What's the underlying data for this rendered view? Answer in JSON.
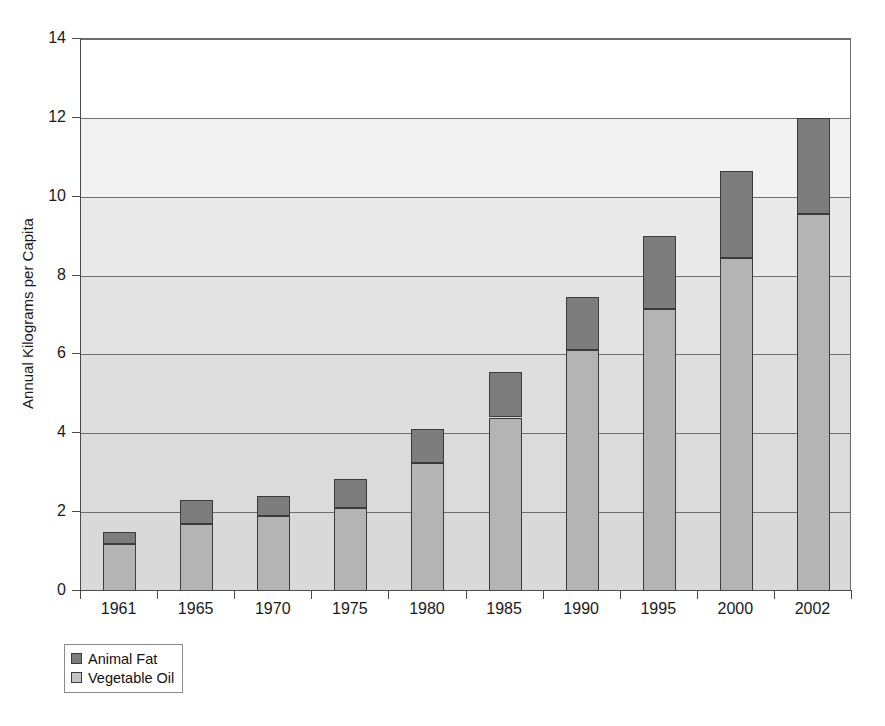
{
  "chart_data": {
    "type": "bar",
    "subtype": "stacked-bar",
    "title": "",
    "xlabel": "",
    "ylabel": "Annual Kilograms per Capita",
    "ylim": [
      0,
      14
    ],
    "ytick_step": 2,
    "yticks": [
      "0",
      "2",
      "4",
      "6",
      "8",
      "10",
      "12",
      "14"
    ],
    "grid": "horizontal",
    "legend_position": "below-left",
    "categories": [
      "1961",
      "1965",
      "1970",
      "1975",
      "1980",
      "1985",
      "1990",
      "1995",
      "2000",
      "2002"
    ],
    "series": [
      {
        "name": "Vegetable Oil",
        "color": "#b4b4b4",
        "values": [
          1.2,
          1.7,
          1.9,
          2.1,
          3.25,
          4.4,
          6.1,
          7.15,
          8.45,
          9.55
        ]
      },
      {
        "name": "Animal Fat",
        "color": "#7d7d7d",
        "values": [
          0.3,
          0.6,
          0.5,
          0.75,
          0.85,
          1.15,
          1.35,
          1.85,
          2.2,
          2.45
        ]
      }
    ],
    "totals": [
      1.5,
      2.3,
      2.4,
      2.85,
      4.1,
      5.55,
      7.45,
      9.0,
      10.65,
      12.0
    ]
  },
  "legend": {
    "items": [
      {
        "label": "Animal Fat",
        "color": "#7d7d7d"
      },
      {
        "label": "Vegetable Oil",
        "color": "#c4c4c4"
      }
    ]
  },
  "axes": {
    "y_title": "Annual Kilograms per Capita"
  }
}
